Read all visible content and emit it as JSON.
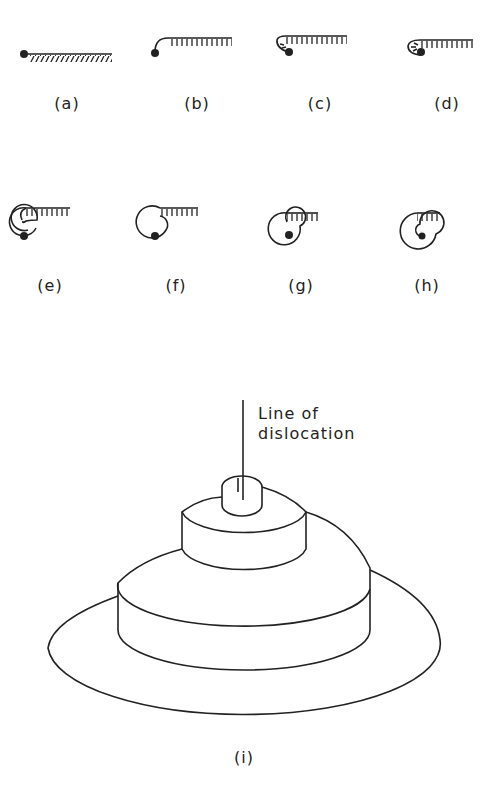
{
  "figure": {
    "panels": [
      {
        "id": "a",
        "label": "(a)",
        "stage": "straight step line, pinned at left end"
      },
      {
        "id": "b",
        "label": "(b)",
        "stage": "step begins curling at pinned end"
      },
      {
        "id": "c",
        "label": "(c)",
        "stage": "step curls further"
      },
      {
        "id": "d",
        "label": "(d)",
        "stage": "step wraps around pinning point"
      },
      {
        "id": "e",
        "label": "(e)",
        "stage": "one turn of spiral"
      },
      {
        "id": "f",
        "label": "(f)",
        "stage": "spiral grows"
      },
      {
        "id": "g",
        "label": "(g)",
        "stage": "spiral tightens"
      },
      {
        "id": "h",
        "label": "(h)",
        "stage": "multi-turn spiral"
      }
    ],
    "spiral_3d": {
      "label": "(i)",
      "annotation_line1": "Line of",
      "annotation_line2": "dislocation"
    },
    "line_color": "#222222",
    "background": "#ffffff"
  }
}
